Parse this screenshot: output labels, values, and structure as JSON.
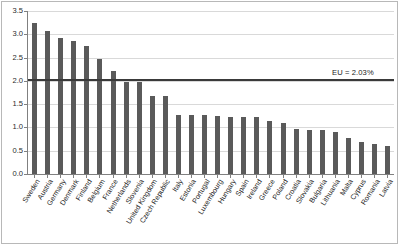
{
  "chart_data": {
    "type": "bar",
    "title": "",
    "xlabel": "",
    "ylabel": "",
    "ylim": [
      0.0,
      3.5
    ],
    "ytick_labels": [
      "3.5",
      "3.0",
      "2.5",
      "2.0",
      "1.5",
      "1.0",
      "0.5",
      "0.0"
    ],
    "ytick_values": [
      3.5,
      3.0,
      2.5,
      2.0,
      1.5,
      1.0,
      0.5,
      0.0
    ],
    "grid": true,
    "legend": "none",
    "bar_color": "#5a5a5a",
    "categories": [
      "Sweden",
      "Austria",
      "Germany",
      "Denmark",
      "Finland",
      "Belgium",
      "France",
      "Netherlands",
      "Slovenia",
      "United Kingdom",
      "Czech Republic",
      "Italy",
      "Estonia",
      "Portugal",
      "Luxembourg",
      "Hungary",
      "Spain",
      "Ireland",
      "Greece",
      "Poland",
      "Croatia",
      "Slovakia",
      "Bulgaria",
      "Lithuania",
      "Malta",
      "Cyprus",
      "Romania",
      "Latvia"
    ],
    "values": [
      3.25,
      3.07,
      2.92,
      2.85,
      2.75,
      2.48,
      2.22,
      1.98,
      1.98,
      1.67,
      1.67,
      1.27,
      1.27,
      1.26,
      1.25,
      1.23,
      1.22,
      1.22,
      1.13,
      1.09,
      0.97,
      0.95,
      0.95,
      0.91,
      0.77,
      0.68,
      0.65,
      0.6
    ],
    "annotations": [
      {
        "name": "eu-average-line",
        "label": "EU = 2.03%",
        "value": 2.03,
        "color": "#3a3a3a"
      }
    ]
  }
}
